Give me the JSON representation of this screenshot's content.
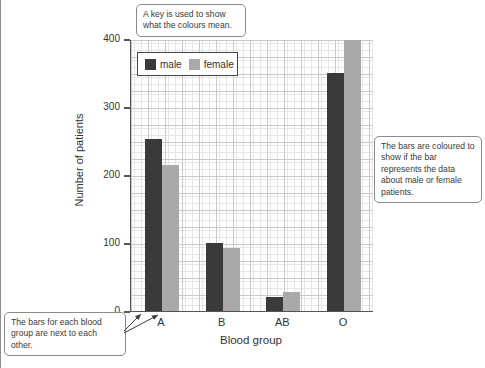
{
  "chart_data": {
    "type": "bar",
    "title": "",
    "xlabel": "Blood group",
    "ylabel": "Number of patients",
    "categories": [
      "A",
      "B",
      "AB",
      "O"
    ],
    "series": [
      {
        "name": "male",
        "color": "#3a3a3a",
        "values": [
          253,
          100,
          20,
          350
        ]
      },
      {
        "name": "female",
        "color": "#a9a9a9",
        "values": [
          215,
          93,
          28,
          400
        ]
      }
    ],
    "ylim": [
      0,
      400
    ],
    "yticks": [
      0,
      100,
      200,
      300,
      400
    ],
    "ytick_labels": [
      "0",
      "100",
      "200",
      "300",
      "400"
    ],
    "grid": true,
    "grid_minor_step": 5,
    "grid_major_step": 25,
    "legend_position": "upper-left-inside"
  },
  "legend": {
    "items": [
      {
        "label": "male",
        "color": "#3a3a3a"
      },
      {
        "label": "female",
        "color": "#a9a9a9"
      }
    ]
  },
  "callouts": {
    "key": "A key is used to show what the colours mean.",
    "colours": "The bars are coloured to show if the bar represents the data about male or female patients.",
    "grouping": "The bars for each blood group are next to each other."
  }
}
